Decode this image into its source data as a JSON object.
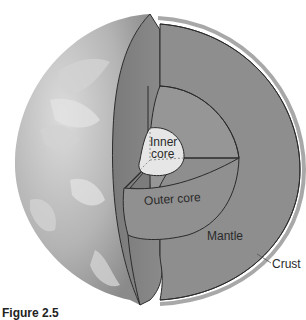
{
  "figure": {
    "caption": "Figure 2.5",
    "labels": {
      "inner_core_line1": "Inner",
      "inner_core_line2": "core",
      "outer_core": "Outer core",
      "mantle": "Mantle",
      "crust": "Crust"
    },
    "colors": {
      "globe_surface": "#b8b8b8",
      "mantle": "#8e8e8e",
      "mantle_face": "#7f7f7f",
      "outer_core": "#949494",
      "inner_core": "#e6e6e6",
      "outline": "#2b2b2b"
    }
  }
}
